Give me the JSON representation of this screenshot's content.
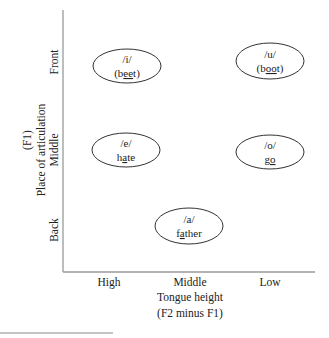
{
  "diagram": {
    "y_axis": {
      "title": "Place of articulation",
      "subtitle": "(F1)",
      "ticks": [
        "Front",
        "Middle",
        "Back"
      ]
    },
    "x_axis": {
      "title": "Tongue height",
      "subtitle": "(F2 minus F1)",
      "ticks": [
        "High",
        "Middle",
        "Low"
      ]
    },
    "vowels": [
      {
        "symbol": "/i/",
        "example_pre": "(b",
        "example_ul": "ee",
        "example_post": "t)",
        "row": "Front",
        "col": "High"
      },
      {
        "symbol": "/u/",
        "example_pre": "(b",
        "example_ul": "oo",
        "example_post": "t)",
        "row": "Front",
        "col": "Low"
      },
      {
        "symbol": "/e/",
        "example_pre": "h",
        "example_ul": "a",
        "example_post": "te",
        "row": "Middle",
        "col": "High"
      },
      {
        "symbol": "/o/",
        "example_pre": "g",
        "example_ul": "o",
        "example_post": "",
        "row": "Middle",
        "col": "Low"
      },
      {
        "symbol": "/a/",
        "example_pre": "f",
        "example_ul": "a",
        "example_post": "ther",
        "row": "Back",
        "col": "Middle"
      }
    ],
    "colors": {
      "axis": "#9a9a9a",
      "ellipse_stroke": "#333333",
      "text": "#222222"
    }
  }
}
